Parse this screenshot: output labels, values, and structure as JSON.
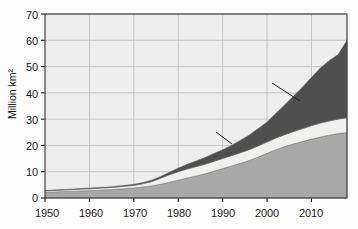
{
  "chart_data": {
    "type": "area",
    "stacked": true,
    "title": "",
    "xlabel": "",
    "ylabel": "Million km²",
    "xlim": [
      1950,
      2018
    ],
    "ylim": [
      0,
      70
    ],
    "yticks": [
      0,
      10,
      20,
      30,
      40,
      50,
      60,
      70
    ],
    "xticks": [
      1950,
      1960,
      1970,
      1980,
      1990,
      2000,
      2010
    ],
    "ytick_labels": [
      "0",
      "10",
      "20",
      "30",
      "40",
      "50",
      "60",
      "70"
    ],
    "xtick_labels": [
      "1950",
      "1960",
      "1970",
      "1980",
      "1990",
      "2000",
      "2010"
    ],
    "grid": true,
    "legend": "in-plot-annotations",
    "x": [
      1950,
      1955,
      1960,
      1965,
      1970,
      1972,
      1974,
      1976,
      1978,
      1980,
      1982,
      1984,
      1986,
      1988,
      1990,
      1992,
      1994,
      1996,
      1998,
      2000,
      2002,
      2004,
      2006,
      2008,
      2010,
      2012,
      2014,
      2016,
      2018
    ],
    "series": [
      {
        "name": "Terrestrial",
        "color": "#a8a8a8",
        "values": [
          2.2,
          2.5,
          2.8,
          3.2,
          3.8,
          4.2,
          4.6,
          5.2,
          6.0,
          6.8,
          7.6,
          8.4,
          9.2,
          10.2,
          11.2,
          12.2,
          13.2,
          14.3,
          15.6,
          17.0,
          18.4,
          19.6,
          20.6,
          21.5,
          22.4,
          23.2,
          23.9,
          24.5,
          24.9
        ]
      },
      {
        "name": "Both",
        "color": "#f0f0ee",
        "values": [
          0.5,
          0.6,
          0.7,
          0.8,
          1.0,
          1.2,
          1.6,
          2.3,
          2.8,
          3.2,
          3.4,
          3.5,
          3.6,
          3.7,
          3.8,
          3.9,
          4.0,
          4.1,
          4.2,
          4.3,
          4.4,
          4.5,
          4.7,
          4.9,
          5.1,
          5.3,
          5.4,
          5.5,
          5.6
        ]
      },
      {
        "name": "Marine",
        "color": "#4f4f4f",
        "values": [
          0.2,
          0.2,
          0.3,
          0.3,
          0.4,
          0.5,
          0.6,
          0.7,
          1.0,
          1.4,
          1.8,
          2.2,
          2.6,
          3.0,
          3.4,
          4.0,
          4.8,
          5.6,
          6.6,
          7.6,
          9.4,
          11.4,
          13.6,
          15.8,
          18.4,
          21.0,
          23.0,
          24.6,
          29.5
        ]
      }
    ],
    "totals_note": "stacked total reaches approximately 60 million km² at the right edge",
    "annotations": [
      {
        "name": "Marine",
        "text": "Marine",
        "x": 2009,
        "y": 46
      },
      {
        "name": "Both",
        "text": "Both",
        "x": 1997,
        "y": 25
      },
      {
        "name": "Terrestrial",
        "text": "Terrestrial",
        "x": 2000,
        "y": 8
      }
    ]
  },
  "axis": {
    "y_title": "Million km²"
  }
}
